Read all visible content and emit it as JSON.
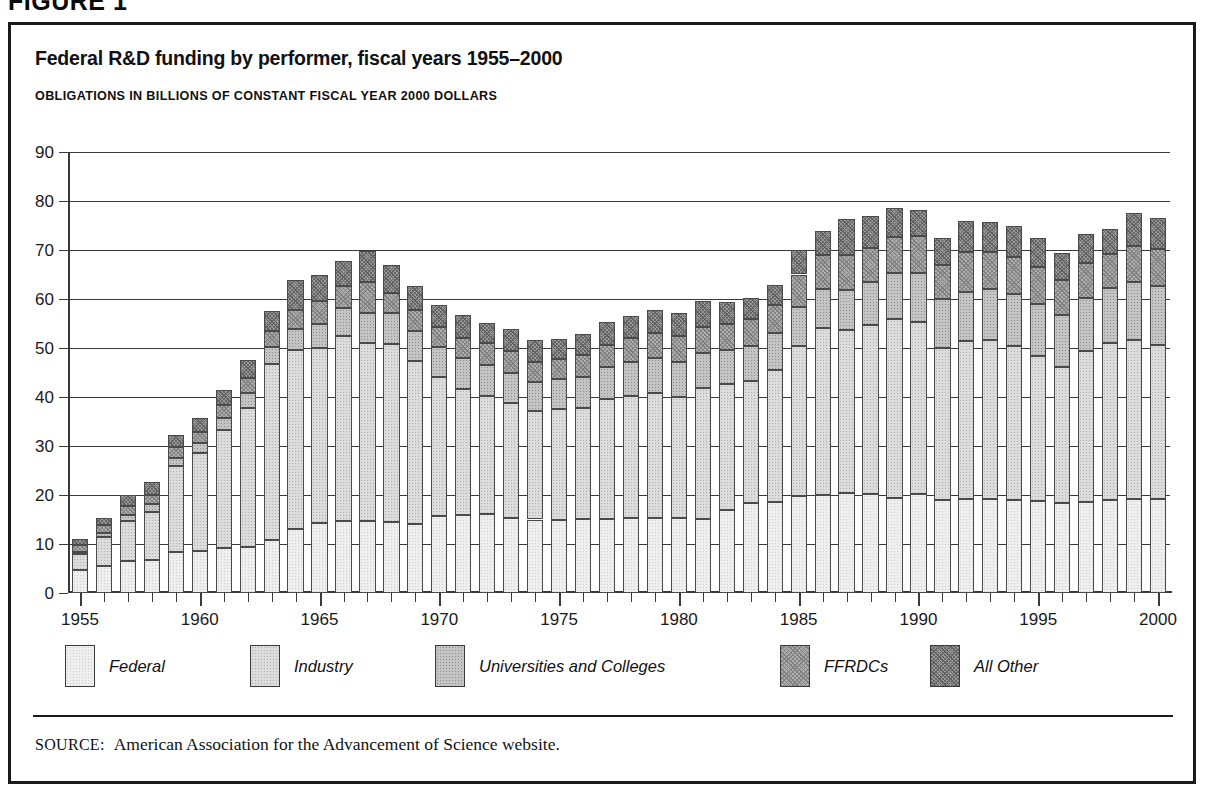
{
  "figure": {
    "label": "FIGURE 1",
    "title": "Federal R&D funding by performer, fiscal years 1955–2000",
    "subtitle": "OBLIGATIONS IN BILLIONS OF CONSTANT FISCAL YEAR 2000 DOLLARS",
    "source_label": "SOURCE:",
    "source_text": "American Association for the Advancement of Science website."
  },
  "axes": {
    "y_ticks": [
      0,
      10,
      20,
      30,
      40,
      50,
      60,
      70,
      80,
      90
    ],
    "y_min": 0,
    "y_max": 90,
    "x_major_labels": [
      "1955",
      "1960",
      "1965",
      "1970",
      "1975",
      "1980",
      "1985",
      "1990",
      "1995",
      "2000"
    ]
  },
  "legend": {
    "items": [
      {
        "label": "Federal",
        "swatch": "s0",
        "x": 30
      },
      {
        "label": "Industry",
        "swatch": "s1",
        "x": 215
      },
      {
        "label": "Universities and Colleges",
        "swatch": "s2",
        "x": 400
      },
      {
        "label": "FFRDCs",
        "swatch": "s3",
        "x": 745
      },
      {
        "label": "All Other",
        "swatch": "s4",
        "x": 895
      }
    ]
  },
  "chart_data": {
    "type": "bar",
    "stacked": true,
    "title": "Federal R&D funding by performer, fiscal years 1955–2000",
    "subtitle": "OBLIGATIONS IN BILLIONS OF CONSTANT FISCAL YEAR 2000 DOLLARS",
    "xlabel": "",
    "ylabel": "OBLIGATIONS IN BILLIONS OF CONSTANT FISCAL YEAR 2000 DOLLARS",
    "ylim": [
      0,
      90
    ],
    "ytick_step": 10,
    "grid": "horizontal",
    "legend_position": "bottom",
    "categories": [
      "1955",
      "1956",
      "1957",
      "1958",
      "1959",
      "1960",
      "1961",
      "1962",
      "1963",
      "1964",
      "1965",
      "1966",
      "1967",
      "1968",
      "1969",
      "1970",
      "1971",
      "1972",
      "1973",
      "1974",
      "1975",
      "1976",
      "1977",
      "1978",
      "1979",
      "1980",
      "1981",
      "1982",
      "1983",
      "1984",
      "1985",
      "1986",
      "1987",
      "1988",
      "1989",
      "1990",
      "1991",
      "1992",
      "1993",
      "1994",
      "1995",
      "1996",
      "1997",
      "1998",
      "1999",
      "2000"
    ],
    "series": [
      {
        "name": "Federal",
        "values": [
          4.6,
          5.5,
          6.5,
          6.7,
          8.3,
          8.6,
          9.1,
          9.4,
          10.8,
          13.1,
          14.3,
          14.6,
          14.7,
          14.5,
          14.1,
          15.7,
          15.9,
          16.1,
          15.4,
          15.0,
          15.0,
          15.2,
          15.1,
          15.3,
          15.4,
          15.4,
          15.2,
          16.9,
          18.3,
          18.5,
          19.7,
          20.1,
          20.4,
          20.3,
          19.3,
          20.3,
          18.9,
          19.1,
          19.2,
          18.9,
          18.7,
          18.4,
          18.6,
          18.9,
          19.1,
          19.2
        ]
      },
      {
        "name": "Industry",
        "values": [
          3.3,
          5.9,
          8.2,
          9.9,
          17.6,
          19.9,
          24.1,
          28.3,
          35.9,
          36.4,
          35.6,
          37.9,
          36.4,
          36.3,
          33.3,
          28.4,
          25.8,
          24.1,
          23.3,
          22.1,
          22.5,
          22.6,
          24.5,
          25.0,
          25.4,
          24.5,
          26.7,
          25.8,
          24.9,
          27.0,
          30.7,
          34.0,
          33.2,
          34.3,
          36.7,
          35.1,
          31.1,
          32.3,
          32.4,
          31.6,
          29.6,
          27.8,
          30.8,
          32.1,
          32.6,
          31.4
        ]
      },
      {
        "name": "Universities and Colleges",
        "values": [
          0.5,
          0.9,
          1.2,
          1.5,
          1.7,
          2.1,
          2.6,
          3.1,
          3.6,
          4.3,
          5.0,
          5.6,
          6.1,
          6.3,
          6.1,
          6.1,
          6.3,
          6.4,
          6.2,
          6.0,
          6.2,
          6.3,
          6.5,
          6.9,
          7.2,
          7.3,
          7.1,
          6.9,
          7.2,
          7.6,
          8.0,
          8.0,
          8.2,
          8.8,
          9.3,
          9.9,
          10.0,
          10.1,
          10.4,
          10.6,
          10.6,
          10.5,
          10.9,
          11.2,
          11.7,
          12.1
        ]
      },
      {
        "name": "FFRDCs",
        "values": [
          1.4,
          1.5,
          1.9,
          2.0,
          2.1,
          2.2,
          2.5,
          3.0,
          3.2,
          4.0,
          4.6,
          4.5,
          6.3,
          4.2,
          4.2,
          4.0,
          4.0,
          4.4,
          4.4,
          4.1,
          4.1,
          4.4,
          4.5,
          4.8,
          5.1,
          5.3,
          5.2,
          5.2,
          5.5,
          5.7,
          6.6,
          6.9,
          7.1,
          7.0,
          7.3,
          7.6,
          6.9,
          8.0,
          7.5,
          7.5,
          7.6,
          7.2,
          7.0,
          7.0,
          7.4,
          7.6
        ]
      },
      {
        "name": "All Other",
        "values": [
          1.3,
          1.6,
          2.3,
          2.5,
          2.6,
          3.0,
          3.1,
          3.8,
          4.0,
          6.0,
          5.3,
          5.2,
          6.2,
          5.6,
          4.9,
          4.6,
          4.8,
          4.2,
          4.5,
          4.5,
          4.0,
          4.3,
          4.7,
          4.5,
          4.7,
          4.7,
          5.4,
          4.6,
          4.3,
          4.1,
          4.9,
          4.8,
          7.4,
          6.5,
          6.0,
          5.3,
          5.6,
          6.4,
          6.3,
          6.2,
          5.9,
          5.4,
          6.0,
          5.1,
          6.8,
          6.3
        ]
      }
    ]
  }
}
